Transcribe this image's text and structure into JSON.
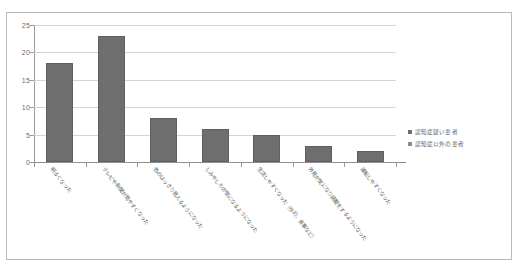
{
  "chart_data": {
    "type": "bar",
    "title": "",
    "subtitle": "",
    "xlabel": "",
    "ylabel": "",
    "ylim": [
      0,
      25
    ],
    "ytick_step": 5,
    "yticks": [
      "0",
      "5",
      "10",
      "15",
      "20",
      "25"
    ],
    "grid": true,
    "legend_position": "right",
    "categories": [
      "明るくなった",
      "テレビや新聞が見やすくなった",
      "色のはっきり見えるようになった",
      "しみやしわが気になるようになった",
      "生活しやすくなった（歩行、食事など）",
      "外見が気になり調髪をするようになった",
      "運転しやすくなった"
    ],
    "series": [
      {
        "name": "認知症疑い患者",
        "values": [
          18,
          23,
          8,
          6,
          5,
          3,
          2
        ],
        "color": "#6e6e6e"
      }
    ],
    "legend": [
      {
        "label": "認知症疑い患者",
        "color": "#6e6e6e"
      },
      {
        "label": "認知症以外の患者",
        "color": "#8c8c8c"
      }
    ],
    "colors": {
      "bar": "#6e6e6e",
      "bar_border": "#5f5f5f",
      "gridline": "#d4d4d4",
      "axis": "#9a9a9a",
      "frame": "#b9b9b9",
      "text": "#5d5d5d",
      "background": "#ffffff"
    }
  }
}
